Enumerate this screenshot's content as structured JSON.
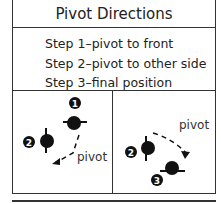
{
  "header": {
    "title": "Pivot Directions"
  },
  "steps": [
    "Step 1–pivot to front",
    "Step 2–pivot to other side",
    "Step 3–final position"
  ],
  "panels": [
    {
      "label": "pivot",
      "markers": [
        "1",
        "2"
      ]
    },
    {
      "label": "pivot",
      "markers": [
        "2",
        "3"
      ]
    }
  ]
}
